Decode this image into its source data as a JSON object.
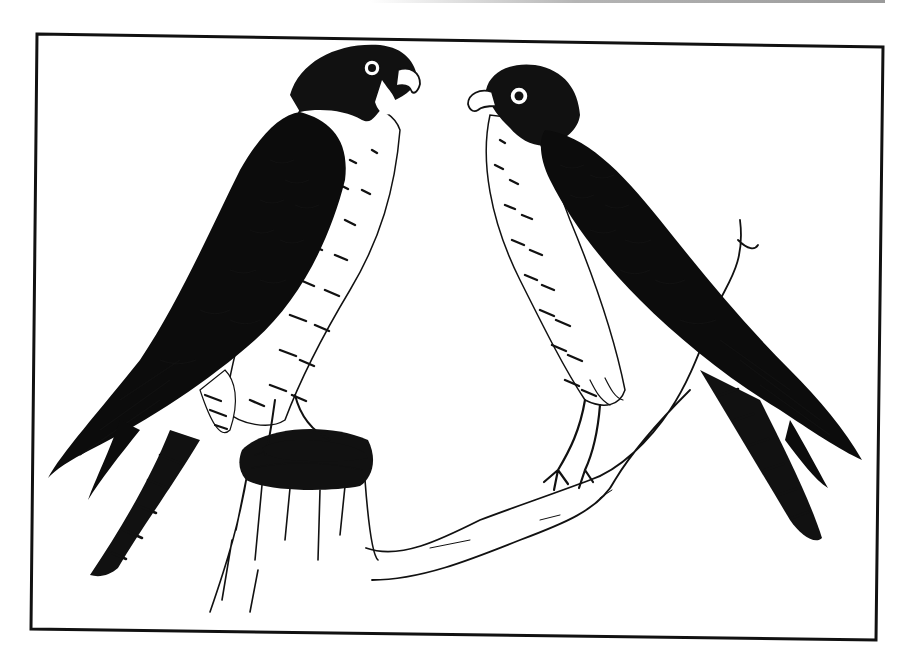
{
  "image": {
    "subject": "Pen-and-ink illustration of two peregrine falcons",
    "style": "black and white line drawing",
    "frame": {
      "stroke_color": "#111111",
      "corners": {
        "top_left": [
          37,
          34
        ],
        "top_right": [
          883,
          47
        ],
        "bottom_right": [
          876,
          640
        ],
        "bottom_left": [
          31,
          629
        ]
      }
    },
    "elements": [
      {
        "name": "left-falcon",
        "pose": "perched on stump, facing right",
        "position": "left"
      },
      {
        "name": "right-falcon",
        "pose": "perched on branch, facing left",
        "position": "right"
      },
      {
        "name": "tree-stump",
        "position": "bottom-left center"
      },
      {
        "name": "branch",
        "position": "bottom center to right"
      }
    ],
    "colors": {
      "ink": "#111111",
      "paper": "#ffffff"
    }
  }
}
